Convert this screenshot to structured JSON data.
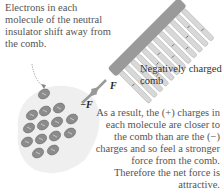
{
  "captions": {
    "insulator_note": "Electrons in each molecule of the neutral insulator shift away from the comb.",
    "comb_label": "Negatively charged comb",
    "result_note": "As a result, the (+) charges in each molecule are closer to the comb than are the (−) charges and so feel a stronger force from the comb. Therefore the net force is attractive."
  },
  "force_labels": {
    "force_on_comb": "F⃗",
    "force_on_insulator": "−F⃗"
  },
  "colors": {
    "comb_spine": "#9a9a9a",
    "comb_teeth": "#d8d8d8",
    "insulator_bg": "#eeeeee",
    "molecule_fill": "#8c8c8c",
    "arrow": "#888888",
    "text": "#555555"
  },
  "molecules": {
    "count": 14,
    "symbols": [
      "+",
      "−"
    ]
  }
}
